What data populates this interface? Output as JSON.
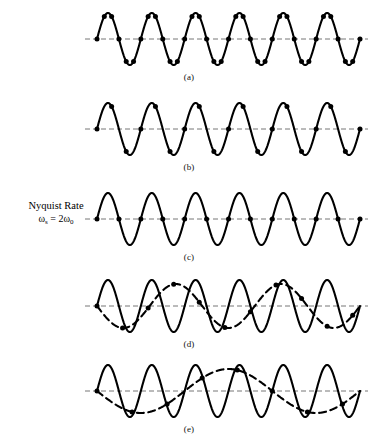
{
  "figure": {
    "background_color": "#ffffff",
    "stroke_color": "#000000",
    "axis_color": "#777777",
    "annotation": {
      "title": "Nyquist Rate",
      "formula_omega": "ω",
      "formula_sub_s": "s",
      "formula_equals": " = 2",
      "formula_omega2": "ω",
      "formula_sub_0": "0"
    },
    "panels": [
      {
        "id": "a",
        "label": "(a)",
        "signal_cycles": 6,
        "samples_per_cycle": 6,
        "sample_count": 37,
        "sample_phase_offset": 0,
        "has_alias": false,
        "alias_cycles": 0,
        "alias_phase": 0,
        "description": "oversampled sinusoid, six samples per cycle"
      },
      {
        "id": "b",
        "label": "(b)",
        "signal_cycles": 6,
        "samples_per_cycle": 3,
        "sample_count": 19,
        "sample_phase_offset": 0,
        "has_alias": false,
        "alias_cycles": 0,
        "alias_phase": 0,
        "description": "three samples per cycle"
      },
      {
        "id": "c",
        "label": "(c)",
        "signal_cycles": 6,
        "samples_per_cycle": 2,
        "sample_count": 13,
        "sample_phase_offset": 0,
        "has_alias": false,
        "alias_cycles": 0,
        "alias_phase": 0,
        "description": "Nyquist rate, two samples per cycle at zero crossings"
      },
      {
        "id": "d",
        "label": "(d)",
        "signal_cycles": 6,
        "samples_per_cycle": 1.7142857,
        "sample_count": 11,
        "sample_phase_offset": 0,
        "has_alias": true,
        "alias_cycles": 2.5,
        "alias_phase": 180,
        "description": "undersampled, aliased to a lower frequency sinusoid"
      },
      {
        "id": "e",
        "label": "(e)",
        "signal_cycles": 6,
        "samples_per_cycle": 1.25,
        "sample_count": 8,
        "sample_phase_offset": 0,
        "has_alias": true,
        "alias_cycles": 1.5,
        "alias_phase": 180,
        "description": "severely undersampled, slow alias sinusoid"
      }
    ]
  },
  "chart_data": {
    "type": "line",
    "xlabel": "",
    "ylabel": "",
    "grid": false,
    "legend": null,
    "annotations": [
      "Nyquist Rate",
      "ωs = 2ω0",
      "(a)",
      "(b)",
      "(c)",
      "(d)",
      "(e)"
    ],
    "series": [
      {
        "name": "(a) signal",
        "cycles": 6,
        "style": "solid",
        "samples": 37
      },
      {
        "name": "(b) signal",
        "cycles": 6,
        "style": "solid",
        "samples": 19
      },
      {
        "name": "(c) signal",
        "cycles": 6,
        "style": "solid",
        "samples": 13
      },
      {
        "name": "(d) signal",
        "cycles": 6,
        "style": "solid",
        "samples": 11
      },
      {
        "name": "(d) alias",
        "cycles": 2.5,
        "style": "dashed",
        "samples": 0
      },
      {
        "name": "(e) signal",
        "cycles": 6,
        "style": "solid",
        "samples": 8
      },
      {
        "name": "(e) alias",
        "cycles": 1.5,
        "style": "dashed",
        "samples": 0
      }
    ]
  }
}
